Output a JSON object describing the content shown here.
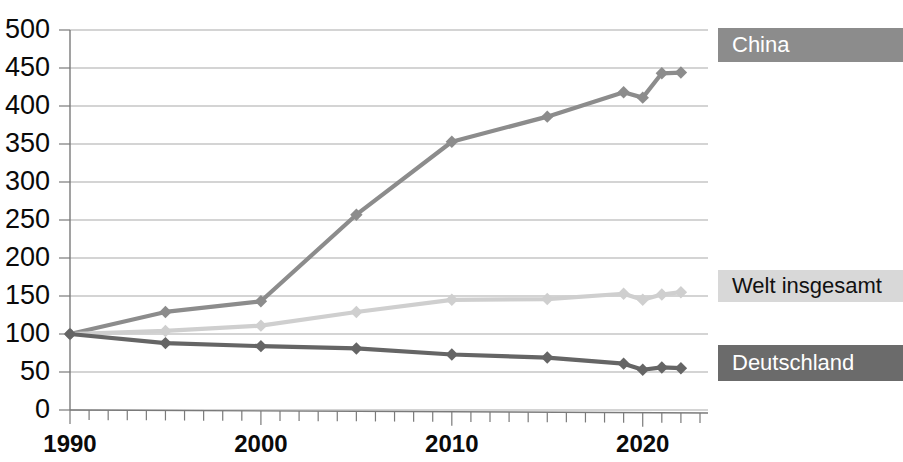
{
  "chart_data": {
    "type": "line",
    "title": "",
    "subtitle": "",
    "xlabel": "",
    "ylabel": "",
    "xlim": [
      1990,
      2023
    ],
    "ylim": [
      0,
      500
    ],
    "grid": true,
    "legend_position": "right",
    "y_ticks": [
      "500",
      "450",
      "400",
      "350",
      "300",
      "250",
      "200",
      "150",
      "100",
      "50",
      "0"
    ],
    "y_tick_values": [
      500,
      450,
      400,
      350,
      300,
      250,
      200,
      150,
      100,
      50,
      0
    ],
    "x_ticks": [
      "1990",
      "2000",
      "2010",
      "2020"
    ],
    "x_tick_values": [
      1990,
      2000,
      2010,
      2020
    ],
    "x_minor_tick_interval": 1,
    "x": [
      1990,
      1995,
      2000,
      2005,
      2010,
      2015,
      2019,
      2020,
      2021,
      2022
    ],
    "series": [
      {
        "name": "China",
        "color": "#8c8c8c",
        "marker": "diamond",
        "values": [
          100,
          129,
          143,
          257,
          353,
          386,
          418,
          411,
          443,
          444
        ]
      },
      {
        "name": "Welt insgesamt",
        "color": "#cfcfcf",
        "marker": "diamond",
        "values": [
          100,
          104,
          111,
          129,
          145,
          146,
          153,
          145,
          152,
          155
        ]
      },
      {
        "name": "Deutschland",
        "color": "#656565",
        "marker": "diamond",
        "values": [
          100,
          88,
          84,
          81,
          73,
          69,
          61,
          53,
          56,
          55
        ]
      }
    ]
  },
  "legend": {
    "items": [
      {
        "label": "China",
        "box_color": "#8c8c8c",
        "text_color": "#ffffff"
      },
      {
        "label": "Welt insgesamt",
        "box_color": "#d8d8d8",
        "text_color": "#111111"
      },
      {
        "label": "Deutschland",
        "box_color": "#6b6b6b",
        "text_color": "#ffffff"
      }
    ]
  }
}
